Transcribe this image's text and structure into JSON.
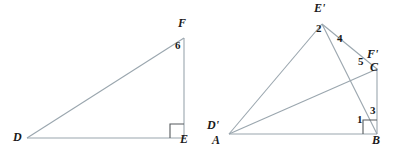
{
  "figure": {
    "background_color": "#ffffff",
    "line_color": "#9aa6ae",
    "label_color": "#1a1a1a",
    "right_angle_color": "#55595c",
    "left_figure": {
      "name": "triangle-DEF",
      "vertices": [
        {
          "id": "D",
          "label": "D",
          "x": 27,
          "y": 138
        },
        {
          "id": "E",
          "label": "E",
          "x": 184,
          "y": 138
        },
        {
          "id": "F",
          "label": "F",
          "x": 184,
          "y": 38
        }
      ],
      "edges": [
        {
          "from": "D",
          "to": "E"
        },
        {
          "from": "E",
          "to": "F"
        },
        {
          "from": "F",
          "to": "D"
        }
      ],
      "vertex_labels": [
        {
          "text": "D",
          "x": 13,
          "y": 139
        },
        {
          "text": "E",
          "x": 180,
          "y": 140
        },
        {
          "text": "F",
          "x": 178,
          "y": 23
        }
      ],
      "side_labels": [
        {
          "text": "6",
          "x": 176,
          "y": 44
        }
      ],
      "right_angle_at": "E"
    },
    "right_figure": {
      "name": "triangle-cluster-ABC-DEF-prime",
      "vertices": [
        {
          "id": "A",
          "label": "A",
          "x": 229,
          "y": 134
        },
        {
          "id": "Dprime",
          "label": "D'",
          "x": 229,
          "y": 134
        },
        {
          "id": "B",
          "label": "B",
          "x": 377,
          "y": 134
        },
        {
          "id": "C",
          "label": "C",
          "x": 377,
          "y": 69
        },
        {
          "id": "Fprime",
          "label": "F'",
          "x": 377,
          "y": 69
        },
        {
          "id": "Eprime",
          "label": "E'",
          "x": 322,
          "y": 24
        }
      ],
      "edges": [
        {
          "from": "A",
          "to": "B"
        },
        {
          "from": "B",
          "to": "C"
        },
        {
          "from": "C",
          "to": "A"
        },
        {
          "from": "A",
          "to": "Eprime"
        },
        {
          "from": "Eprime",
          "to": "Fprime"
        },
        {
          "from": "Eprime",
          "to": "B"
        }
      ],
      "vertex_labels": [
        {
          "text": "D'",
          "x": 209,
          "y": 125
        },
        {
          "text": "A",
          "x": 213,
          "y": 141
        },
        {
          "text": "B",
          "x": 373,
          "y": 140
        },
        {
          "text": "F'",
          "x": 368,
          "y": 55
        },
        {
          "text": "C",
          "x": 371,
          "y": 68
        },
        {
          "text": "E'",
          "x": 315,
          "y": 6
        }
      ],
      "angle_labels": [
        {
          "text": "1",
          "x": 358,
          "y": 119
        },
        {
          "text": "2",
          "x": 317,
          "y": 27
        },
        {
          "text": "3",
          "x": 371,
          "y": 110
        },
        {
          "text": "4",
          "x": 338,
          "y": 37
        },
        {
          "text": "5",
          "x": 359,
          "y": 61
        }
      ],
      "right_angle_at": "B"
    }
  }
}
